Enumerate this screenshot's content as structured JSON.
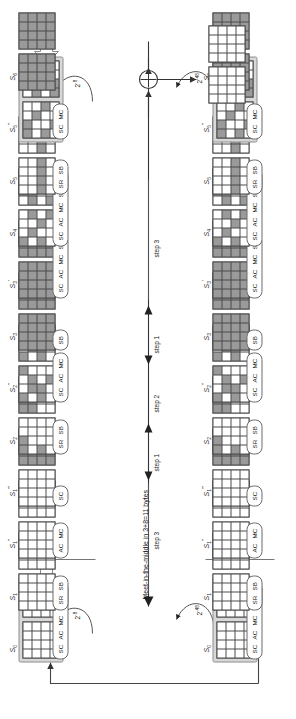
{
  "figure": {
    "caption": "Meet-in-the-middle in 3+8=11 bytes",
    "orientation_deg": -90,
    "grid_size": "4x4",
    "cell_legend": {
      "white": "inactive byte",
      "light": "active / known byte",
      "dark": "guessed / difference byte"
    }
  },
  "steps": [
    {
      "name": "step 3",
      "style": "plain"
    },
    {
      "name": "step 1",
      "style": "arrow-down"
    },
    {
      "name": "step 2",
      "style": "arrow-both"
    },
    {
      "name": "step 1",
      "style": "arrow-up"
    },
    {
      "name": "step 3",
      "style": "plain"
    }
  ],
  "probabilities": [
    {
      "label": "2",
      "exp": "-8"
    },
    {
      "label": "2",
      "exp": "-48"
    },
    {
      "label": "2",
      "exp": "-8"
    },
    {
      "label": "2",
      "exp": "-48"
    }
  ],
  "chain": {
    "left": [
      {
        "state": "S0",
        "sub": "0",
        "primes": "",
        "ops": [
          "SC",
          "AC",
          "MC",
          "SR",
          "SB"
        ],
        "boxed": true,
        "g1": [
          0,
          0,
          0,
          0,
          0,
          0,
          0,
          0,
          0,
          0,
          0,
          0,
          0,
          0,
          0,
          0
        ],
        "g2": [
          0,
          0,
          1,
          2,
          0,
          2,
          1,
          0,
          0,
          1,
          0,
          0,
          0,
          0,
          0,
          0
        ]
      },
      {
        "state": "S1",
        "sub": "1",
        "primes": "",
        "ops": [
          "SR",
          "SB"
        ],
        "boxed": false,
        "g1": [
          0,
          0,
          0,
          0,
          0,
          0,
          0,
          0,
          0,
          0,
          0,
          0,
          0,
          0,
          0,
          0
        ],
        "g2": [
          0,
          0,
          0,
          2,
          0,
          0,
          0,
          0,
          0,
          0,
          0,
          0,
          0,
          0,
          2,
          0
        ]
      },
      {
        "state": "S1",
        "sub": "1",
        "primes": "''",
        "ops": [
          "AC",
          "MC"
        ],
        "boxed": false,
        "g1": [
          0,
          0,
          0,
          0,
          0,
          0,
          0,
          0,
          0,
          0,
          0,
          0,
          0,
          0,
          0,
          0
        ],
        "g2": [
          0,
          0,
          0,
          2,
          0,
          0,
          0,
          0,
          0,
          0,
          0,
          1,
          0,
          0,
          2,
          0
        ]
      },
      {
        "state": "S1",
        "sub": "1",
        "primes": "'''",
        "ops": [
          "SC"
        ],
        "boxed": false,
        "g1": [
          0,
          0,
          0,
          0,
          0,
          0,
          0,
          0,
          0,
          0,
          0,
          0,
          0,
          0,
          0,
          0
        ],
        "g2": [
          1,
          1,
          1,
          1,
          1,
          1,
          1,
          1,
          1,
          1,
          1,
          1,
          1,
          1,
          1,
          1
        ]
      },
      {
        "state": "S2",
        "sub": "2",
        "primes": "",
        "ops": [
          "SR",
          "SB"
        ],
        "boxed": false,
        "g1": [
          1,
          1,
          0,
          0,
          0,
          0,
          0,
          0,
          1,
          0,
          0,
          0,
          0,
          0,
          0,
          0
        ],
        "g2": [
          1,
          1,
          1,
          1,
          1,
          1,
          1,
          1,
          0,
          0,
          0,
          0,
          0,
          0,
          0,
          0
        ]
      },
      {
        "state": "S2",
        "sub": "2",
        "primes": "''",
        "ops": [
          "SC",
          "AC",
          "MC"
        ],
        "boxed": false,
        "g1": [
          1,
          0,
          0,
          1,
          0,
          1,
          1,
          0,
          1,
          1,
          0,
          0,
          0,
          0,
          1,
          0
        ],
        "g2": [
          1,
          0,
          0,
          1,
          0,
          1,
          1,
          0,
          1,
          1,
          0,
          0,
          0,
          0,
          1,
          0
        ]
      },
      {
        "state": "S3",
        "sub": "3",
        "primes": "",
        "ops": [
          "SB"
        ],
        "boxed": false,
        "g1": [
          1,
          1,
          1,
          1,
          1,
          1,
          1,
          1,
          1,
          1,
          1,
          1,
          1,
          1,
          1,
          1
        ],
        "g2": [
          1,
          1,
          1,
          1,
          1,
          1,
          1,
          1,
          1,
          1,
          1,
          1,
          1,
          1,
          1,
          1
        ]
      },
      {
        "state": "S3",
        "sub": "3",
        "primes": "'",
        "ops": [
          "SC",
          "AC",
          "MC",
          "SR"
        ],
        "boxed": false,
        "g1": [
          1,
          1,
          1,
          1,
          1,
          1,
          1,
          1,
          1,
          1,
          1,
          1,
          1,
          1,
          1,
          1
        ],
        "g2": [
          1,
          1,
          1,
          1,
          1,
          1,
          1,
          1,
          1,
          1,
          1,
          1,
          1,
          1,
          1,
          1
        ]
      },
      {
        "state": "S4",
        "sub": "4",
        "primes": "",
        "ops": [
          "SC",
          "AC",
          "MC",
          "SR",
          "SB"
        ],
        "boxed": false,
        "g1": [
          1,
          0,
          0,
          0,
          0,
          1,
          0,
          1,
          1,
          0,
          1,
          0,
          0,
          0,
          0,
          1
        ],
        "g2": [
          0,
          1,
          0,
          0,
          1,
          1,
          0,
          0,
          0,
          0,
          1,
          1,
          1,
          0,
          0,
          0
        ]
      },
      {
        "state": "S5",
        "sub": "5",
        "primes": "",
        "ops": [
          "SR",
          "SB"
        ],
        "boxed": false,
        "g1": [
          0,
          0,
          0,
          0,
          0,
          0,
          0,
          0,
          1,
          1,
          1,
          1,
          0,
          0,
          0,
          0
        ],
        "g2": [
          0,
          0,
          1,
          1,
          0,
          0,
          0,
          0,
          1,
          1,
          0,
          0,
          0,
          0,
          0,
          0
        ]
      },
      {
        "state": "S5",
        "sub": "5",
        "primes": "''",
        "ops": [
          "SC",
          "MC"
        ],
        "boxed": true,
        "g1": [
          1,
          1,
          0,
          0,
          0,
          0,
          1,
          0,
          1,
          0,
          0,
          1,
          0,
          1,
          0,
          0
        ],
        "g2": [
          0,
          1,
          1,
          0,
          1,
          0,
          0,
          1,
          0,
          0,
          1,
          0,
          1,
          1,
          0,
          0
        ]
      },
      {
        "state": "S6",
        "sub": "6",
        "primes": "",
        "ops": [],
        "boxed": false,
        "g1": [
          1,
          1,
          1,
          1,
          1,
          1,
          1,
          1,
          1,
          1,
          1,
          1,
          1,
          1,
          1,
          1
        ],
        "g2": [
          1,
          1,
          1,
          1,
          1,
          1,
          1,
          1,
          1,
          1,
          1,
          1,
          1,
          1,
          1,
          1
        ]
      }
    ],
    "right": [
      {
        "state": "S0",
        "sub": "0",
        "primes": "",
        "ops": [
          "SC",
          "AC",
          "MC",
          "SR",
          "SB"
        ],
        "boxed": true,
        "g1": [
          0,
          0,
          0,
          0,
          0,
          0,
          0,
          0,
          0,
          0,
          0,
          0,
          0,
          0,
          0,
          0
        ],
        "g2": [
          0,
          0,
          1,
          2,
          0,
          2,
          1,
          0,
          0,
          1,
          0,
          0,
          0,
          0,
          0,
          0
        ]
      },
      {
        "state": "S1",
        "sub": "1",
        "primes": "",
        "ops": [
          "SR",
          "SB"
        ],
        "boxed": false,
        "g1": [
          0,
          0,
          0,
          0,
          0,
          0,
          0,
          0,
          0,
          0,
          0,
          0,
          0,
          0,
          0,
          0
        ],
        "g2": [
          0,
          0,
          0,
          2,
          0,
          0,
          0,
          0,
          0,
          0,
          0,
          0,
          0,
          0,
          2,
          0
        ]
      },
      {
        "state": "S1",
        "sub": "1",
        "primes": "''",
        "ops": [
          "AC",
          "MC"
        ],
        "boxed": false,
        "g1": [
          0,
          0,
          0,
          0,
          0,
          0,
          0,
          0,
          0,
          0,
          0,
          0,
          0,
          0,
          0,
          0
        ],
        "g2": [
          0,
          0,
          0,
          2,
          0,
          0,
          0,
          0,
          0,
          0,
          0,
          1,
          0,
          0,
          2,
          0
        ]
      },
      {
        "state": "S1",
        "sub": "1",
        "primes": "'''",
        "ops": [
          "SC"
        ],
        "boxed": false,
        "g1": [
          0,
          0,
          0,
          0,
          0,
          0,
          0,
          0,
          0,
          0,
          0,
          0,
          0,
          0,
          0,
          0
        ],
        "g2": [
          1,
          1,
          1,
          1,
          1,
          1,
          1,
          1,
          1,
          1,
          1,
          1,
          1,
          1,
          1,
          1
        ]
      },
      {
        "state": "S2",
        "sub": "2",
        "primes": "",
        "ops": [
          "SR",
          "SB"
        ],
        "boxed": false,
        "g1": [
          1,
          1,
          0,
          0,
          0,
          0,
          0,
          0,
          1,
          0,
          0,
          0,
          0,
          0,
          0,
          0
        ],
        "g2": [
          1,
          1,
          1,
          1,
          1,
          1,
          1,
          1,
          0,
          0,
          0,
          0,
          0,
          0,
          0,
          0
        ]
      },
      {
        "state": "S2",
        "sub": "2",
        "primes": "''",
        "ops": [
          "SC",
          "AC",
          "MC"
        ],
        "boxed": false,
        "g1": [
          1,
          0,
          0,
          1,
          0,
          1,
          1,
          0,
          1,
          1,
          0,
          0,
          0,
          0,
          1,
          0
        ],
        "g2": [
          1,
          0,
          0,
          1,
          0,
          1,
          1,
          0,
          1,
          1,
          0,
          0,
          0,
          0,
          1,
          0
        ]
      },
      {
        "state": "S3",
        "sub": "3",
        "primes": "",
        "ops": [
          "SB"
        ],
        "boxed": false,
        "g1": [
          1,
          1,
          1,
          1,
          1,
          1,
          1,
          1,
          1,
          1,
          1,
          1,
          1,
          1,
          1,
          1
        ],
        "g2": [
          1,
          1,
          1,
          1,
          1,
          1,
          1,
          1,
          1,
          1,
          1,
          1,
          1,
          1,
          1,
          1
        ]
      },
      {
        "state": "S3",
        "sub": "3",
        "primes": "'",
        "ops": [
          "SC",
          "AC",
          "MC",
          "SR"
        ],
        "boxed": false,
        "g1": [
          1,
          1,
          1,
          1,
          1,
          1,
          1,
          1,
          1,
          1,
          1,
          1,
          1,
          1,
          1,
          1
        ],
        "g2": [
          1,
          1,
          1,
          1,
          1,
          1,
          1,
          1,
          1,
          1,
          1,
          1,
          1,
          1,
          1,
          1
        ]
      },
      {
        "state": "S4",
        "sub": "4",
        "primes": "",
        "ops": [
          "SC",
          "AC",
          "MC",
          "SR",
          "SB"
        ],
        "boxed": false,
        "g1": [
          1,
          0,
          0,
          0,
          0,
          1,
          0,
          1,
          1,
          0,
          1,
          0,
          0,
          0,
          0,
          1
        ],
        "g2": [
          0,
          1,
          0,
          0,
          1,
          1,
          0,
          0,
          0,
          0,
          1,
          1,
          1,
          0,
          0,
          0
        ]
      },
      {
        "state": "S5",
        "sub": "5",
        "primes": "",
        "ops": [
          "SR",
          "SB"
        ],
        "boxed": false,
        "g1": [
          0,
          0,
          0,
          0,
          0,
          0,
          0,
          0,
          1,
          1,
          1,
          1,
          0,
          0,
          0,
          0
        ],
        "g2": [
          0,
          0,
          1,
          1,
          0,
          0,
          0,
          0,
          1,
          1,
          0,
          0,
          0,
          0,
          0,
          0
        ]
      },
      {
        "state": "S5",
        "sub": "5",
        "primes": "''",
        "ops": [
          "SC",
          "MC"
        ],
        "boxed": true,
        "g1": [
          1,
          1,
          0,
          0,
          0,
          0,
          1,
          0,
          1,
          0,
          0,
          1,
          0,
          1,
          0,
          0
        ],
        "g2": [
          0,
          1,
          1,
          0,
          1,
          0,
          0,
          1,
          0,
          0,
          1,
          0,
          1,
          1,
          0,
          0
        ]
      },
      {
        "state": "S6",
        "sub": "6",
        "primes": "",
        "ops": [],
        "boxed": false,
        "g1": [
          1,
          1,
          1,
          1,
          1,
          1,
          1,
          1,
          1,
          1,
          1,
          1,
          1,
          1,
          1,
          1
        ],
        "g2": [
          1,
          1,
          1,
          1,
          1,
          1,
          1,
          1,
          1,
          1,
          1,
          1,
          1,
          1,
          1,
          1
        ]
      }
    ],
    "output": {
      "state": "",
      "g1": [
        0,
        0,
        0,
        0,
        0,
        0,
        0,
        0,
        0,
        0,
        0,
        0,
        0,
        0,
        0,
        0
      ],
      "g2": [
        0,
        0,
        0,
        0,
        0,
        0,
        0,
        0,
        0,
        0,
        0,
        0,
        0,
        0,
        0,
        0
      ]
    }
  },
  "xor": {
    "symbol": "+",
    "name": "xor-node"
  }
}
